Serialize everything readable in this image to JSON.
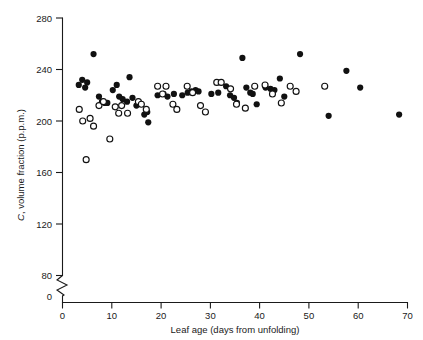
{
  "chart_data": {
    "type": "scatter",
    "title": "",
    "xlabel": "Leaf age (days from unfolding)",
    "ylabel": "C, volume fraction (p.p.m.)",
    "ylabel_italic_prefix": "C",
    "ylabel_rest": ", volume fraction (p.p.m.)",
    "xlim": [
      0,
      70
    ],
    "ylim": [
      80,
      280
    ],
    "y_axis_break": true,
    "y_axis_break_note": "axis broken between 0 and 80",
    "y_origin_label": "0",
    "grid": false,
    "legend": false,
    "xticks": [
      0,
      10,
      20,
      30,
      40,
      50,
      60,
      70
    ],
    "xticklabels": [
      "0",
      "10",
      "20",
      "30",
      "40",
      "50",
      "60",
      "70"
    ],
    "yticks": [
      80,
      120,
      160,
      200,
      240,
      280
    ],
    "yticklabels": [
      "80",
      "120",
      "160",
      "200",
      "240",
      "280"
    ],
    "series": [
      {
        "name": "filled-circles",
        "marker": "filled circle",
        "color": "#111111",
        "points": [
          [
            3.3,
            228
          ],
          [
            4.0,
            232
          ],
          [
            4.6,
            226
          ],
          [
            5.0,
            230
          ],
          [
            6.3,
            252
          ],
          [
            7.4,
            219
          ],
          [
            8.0,
            215
          ],
          [
            8.6,
            214
          ],
          [
            9.1,
            214
          ],
          [
            10.2,
            224
          ],
          [
            11.0,
            228
          ],
          [
            11.5,
            219
          ],
          [
            12.2,
            217
          ],
          [
            13.1,
            215
          ],
          [
            13.6,
            234
          ],
          [
            14.2,
            218
          ],
          [
            15.0,
            212
          ],
          [
            16.6,
            205
          ],
          [
            17.2,
            207
          ],
          [
            17.4,
            199
          ],
          [
            19.3,
            220
          ],
          [
            20.5,
            221
          ],
          [
            21.3,
            219
          ],
          [
            22.6,
            221
          ],
          [
            24.3,
            220
          ],
          [
            25.4,
            222
          ],
          [
            26.2,
            223
          ],
          [
            27.0,
            224
          ],
          [
            27.6,
            223
          ],
          [
            30.2,
            221
          ],
          [
            31.6,
            222
          ],
          [
            33.2,
            227
          ],
          [
            34.0,
            220
          ],
          [
            34.8,
            218
          ],
          [
            35.4,
            214
          ],
          [
            36.5,
            249
          ],
          [
            37.3,
            226
          ],
          [
            38.1,
            222
          ],
          [
            38.6,
            221
          ],
          [
            39.4,
            213
          ],
          [
            41.2,
            226
          ],
          [
            42.2,
            225
          ],
          [
            43.0,
            224
          ],
          [
            44.1,
            233
          ],
          [
            45.0,
            219
          ],
          [
            48.2,
            252
          ],
          [
            54.0,
            204
          ],
          [
            57.6,
            239
          ],
          [
            60.4,
            226
          ],
          [
            68.3,
            205
          ]
        ]
      },
      {
        "name": "open-circles",
        "marker": "open circle",
        "color": "#ffffff",
        "edge_color": "#111111",
        "points": [
          [
            3.4,
            209
          ],
          [
            4.1,
            200
          ],
          [
            4.8,
            170
          ],
          [
            5.6,
            202
          ],
          [
            6.3,
            196
          ],
          [
            7.4,
            212
          ],
          [
            8.3,
            215
          ],
          [
            9.6,
            186
          ],
          [
            10.7,
            211
          ],
          [
            11.4,
            206
          ],
          [
            12.0,
            212
          ],
          [
            13.2,
            206
          ],
          [
            15.4,
            215
          ],
          [
            16.0,
            213
          ],
          [
            17.0,
            209
          ],
          [
            19.3,
            227
          ],
          [
            20.3,
            221
          ],
          [
            21.0,
            227
          ],
          [
            22.4,
            213
          ],
          [
            23.2,
            209
          ],
          [
            25.3,
            227
          ],
          [
            26.4,
            222
          ],
          [
            28.0,
            212
          ],
          [
            29.0,
            207
          ],
          [
            31.3,
            230
          ],
          [
            32.2,
            230
          ],
          [
            34.1,
            225
          ],
          [
            35.3,
            213
          ],
          [
            37.1,
            210
          ],
          [
            39.0,
            227
          ],
          [
            41.1,
            228
          ],
          [
            42.6,
            221
          ],
          [
            44.4,
            214
          ],
          [
            46.2,
            227
          ],
          [
            47.4,
            223
          ],
          [
            53.2,
            227
          ]
        ]
      }
    ]
  }
}
